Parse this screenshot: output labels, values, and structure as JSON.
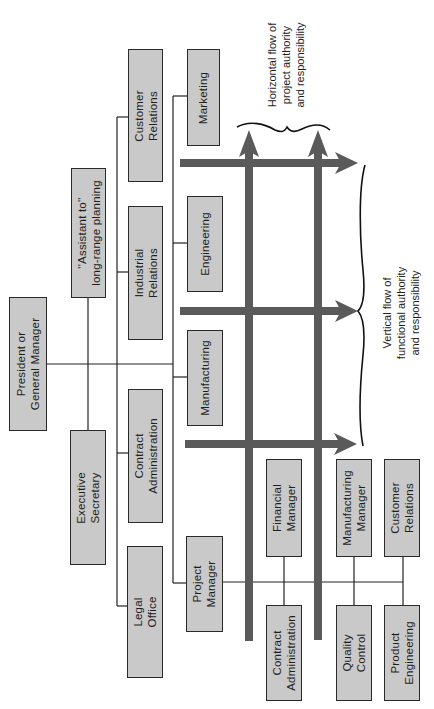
{
  "diagram": {
    "type": "matrix-organization-chart",
    "orientation": "rotated-90-ccw",
    "colors": {
      "box_fill": "#c9c9c9",
      "box_border": "#2a2a2a",
      "flow_arrow": "#5a5a5a",
      "line": "#222222"
    },
    "top_level": {
      "president": "President or\nGeneral Manager"
    },
    "staff": {
      "assistant": "''Assistant to''\nlong-range planning",
      "executive_secretary": "Executive\nSecretary"
    },
    "staff_departments": [
      {
        "label": "Customer\nRelations"
      },
      {
        "label": "Industrial\nRelations"
      },
      {
        "label": "Contract\nAdministration"
      },
      {
        "label": "Legal\nOffice"
      }
    ],
    "functional_departments": [
      {
        "label": "Marketing"
      },
      {
        "label": "Engineering"
      },
      {
        "label": "Manufacturing"
      },
      {
        "label": "Project\nManager"
      }
    ],
    "project_team": {
      "upper": [
        {
          "label": "Financial\nManager"
        },
        {
          "label": "Manufacturing\nManager"
        },
        {
          "label": "Customer\nRelations"
        }
      ],
      "lower": [
        {
          "label": "Contract\nAdministration"
        },
        {
          "label": "Quality\nControl"
        },
        {
          "label": "Product\nEngineering"
        }
      ]
    },
    "annotations": {
      "horizontal_flow": "Horizontal flow of\nproject authority\nand responsibility",
      "vertical_flow": "Vertical flow of\nfunctional authority\nand responsibility"
    },
    "flow_arrows": {
      "vertical_count": 2,
      "horizontal_count": 3
    }
  }
}
